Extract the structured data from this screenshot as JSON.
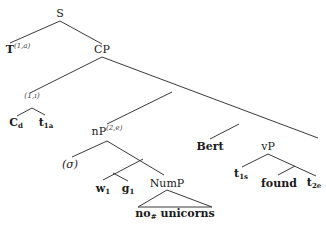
{
  "diagram": {
    "type": "syntax-tree",
    "nodes": {
      "root": {
        "label": "S"
      },
      "t_node": {
        "label": "T",
        "superscript": "(1,a)"
      },
      "cp": {
        "label": "CP"
      },
      "index_node": {
        "label": "(1,ı)"
      },
      "c_d": {
        "label": "C",
        "subscript": "d"
      },
      "t_1a": {
        "label": "t",
        "subscript": "1a"
      },
      "np": {
        "label": "nP",
        "superscript": "(2,e)"
      },
      "sigma": {
        "label": "(σ)"
      },
      "w_1": {
        "label": "w",
        "subscript": "1"
      },
      "g_1": {
        "label": "g",
        "subscript": "1"
      },
      "nump": {
        "label": "NumP"
      },
      "nump_content": {
        "label_no": "no",
        "label_no_sub": "#",
        "label_unicorns": "unicorns"
      },
      "bert": {
        "label": "Bert"
      },
      "vp": {
        "label": "vP"
      },
      "t_1s": {
        "label": "t",
        "subscript": "1s"
      },
      "found": {
        "label": "found"
      },
      "t_2e": {
        "label": "t",
        "subscript": "2e"
      }
    },
    "edges": [
      [
        "S",
        "T"
      ],
      [
        "S",
        "CP"
      ],
      [
        "CP",
        "(1,ı)"
      ],
      [
        "CP",
        "X1"
      ],
      [
        "(1,ı)",
        "C_d"
      ],
      [
        "(1,ı)",
        "t_1a"
      ],
      [
        "X1",
        "nP"
      ],
      [
        "X1",
        "X2"
      ],
      [
        "X2",
        "Bert"
      ],
      [
        "X2",
        "vP"
      ],
      [
        "nP",
        "(σ)"
      ],
      [
        "nP",
        "X3"
      ],
      [
        "X3",
        "X4"
      ],
      [
        "X3",
        "NumP"
      ],
      [
        "X4",
        "w_1"
      ],
      [
        "X4",
        "g_1"
      ],
      [
        "NumP",
        "triangle:no# unicorns"
      ],
      [
        "vP",
        "t_1s"
      ],
      [
        "vP",
        "X5"
      ],
      [
        "X5",
        "found"
      ],
      [
        "X5",
        "t_2e"
      ]
    ]
  }
}
